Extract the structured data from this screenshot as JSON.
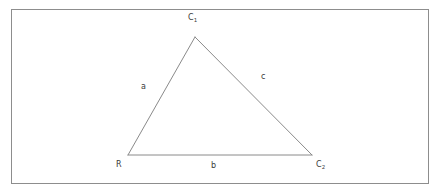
{
  "figure": {
    "type": "geometry-diagram",
    "background_color": "#ffffff",
    "line_color": "#8a8a8a",
    "frame_color": "#8d8d8d",
    "text_color": "#3a3a3a",
    "frame": {
      "x": 11,
      "y": 9,
      "width": 417,
      "height": 174
    },
    "triangle": {
      "vertices": [
        {
          "name": "apex",
          "x": 195,
          "y": 37
        },
        {
          "name": "bottom-left",
          "x": 128,
          "y": 155
        },
        {
          "name": "bottom-right",
          "x": 312,
          "y": 155
        }
      ]
    },
    "vertex_labels": [
      {
        "id": "c1",
        "base": "C",
        "sub": "1",
        "x": 188,
        "y": 13
      },
      {
        "id": "r",
        "base": "R",
        "sub": "",
        "x": 116,
        "y": 160
      },
      {
        "id": "c2",
        "base": "C",
        "sub": "2",
        "x": 316,
        "y": 160
      }
    ],
    "edge_labels": [
      {
        "id": "a",
        "text": "a",
        "x": 141,
        "y": 82
      },
      {
        "id": "b",
        "text": "b",
        "x": 211,
        "y": 161
      },
      {
        "id": "c",
        "text": "c",
        "x": 261,
        "y": 72
      }
    ]
  }
}
